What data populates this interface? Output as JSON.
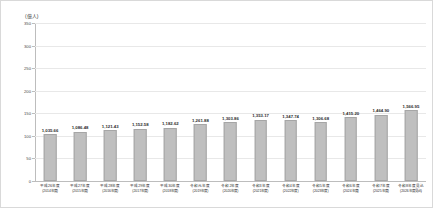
{
  "chart_data": {
    "type": "bar",
    "title": "",
    "subtitle": "",
    "unit_label": "(億人)",
    "xlabel": "",
    "ylabel": "",
    "grid": true,
    "legend": "none",
    "ylim": [
      0,
      350
    ],
    "yticks": [
      0,
      50,
      100,
      150,
      200,
      250,
      300,
      350
    ],
    "ytick_labels": [
      "0",
      "50",
      "100",
      "150",
      "200",
      "250",
      "300",
      "350"
    ],
    "categories": [
      "平成26年度\n(2014年度)",
      "平成27年度\n(2015年度)",
      "平成28年度\n(2016年度)",
      "平成29年度\n(2017年度)",
      "平成30年度\n(2018年度)",
      "令和元年度\n(2019年度)",
      "令和2年度\n(2020年度)",
      "令和3年度\n(2021年度)",
      "令和4年度\n(2022年度)",
      "令和5年度\n(2023年度)",
      "令和6年度\n(2024年度)",
      "令和7年度\n(2025年度)",
      "令和8年度見込\n(2026年度見込)"
    ],
    "category_line1": [
      "平成26年度",
      "平成27年度",
      "平成28年度",
      "平成29年度",
      "平成30年度",
      "令和元年度",
      "令和2年度",
      "令和3年度",
      "令和4年度",
      "令和5年度",
      "令和6年度",
      "令和7年度",
      "令和8年度見込"
    ],
    "category_line2": [
      "(2014年度)",
      "(2015年度)",
      "(2016年度)",
      "(2017年度)",
      "(2018年度)",
      "(2019年度)",
      "(2020年度)",
      "(2021年度)",
      "(2022年度)",
      "(2023年度)",
      "(2024年度)",
      "(2025年度)",
      "(2026年度見込)"
    ],
    "values": [
      103.66,
      108.648,
      112.143,
      115.258,
      118.262,
      126.188,
      130.386,
      135.317,
      134.774,
      130.668,
      141.52,
      146.49,
      156.695
    ],
    "data_labels": [
      "1,035.66",
      "1,086.48",
      "1,121.43",
      "1,152.58",
      "1,182.62",
      "1,261.88",
      "1,303.86",
      "1,353.17",
      "1,347.74",
      "1,306.68",
      "1,415.20",
      "1,464.90",
      "1,566.95"
    ],
    "bar_color": "#bfbfbf",
    "bar_border_color": "#a6a6a6",
    "grid_color": "#e8e8e8",
    "axis_color": "#bdbdbd"
  }
}
